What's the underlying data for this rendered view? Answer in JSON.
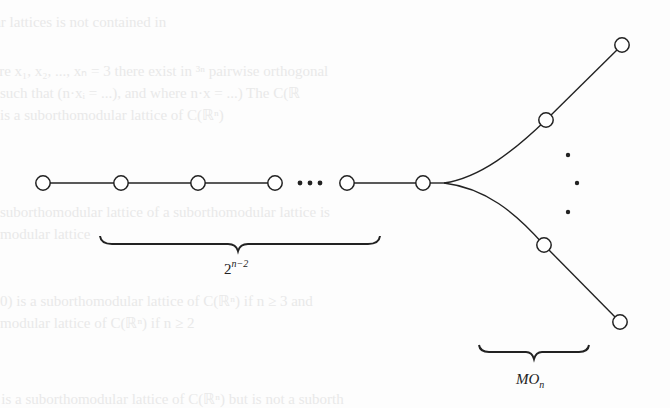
{
  "figure": {
    "type": "lattice-diagram",
    "colors": {
      "stroke": "#222222",
      "node_fill": "#ffffff",
      "background": "#fdfdfd",
      "bleed_text": "#e9e9e9"
    },
    "chain": {
      "nodes": [
        {
          "id": "c1",
          "x": 43,
          "y": 183
        },
        {
          "id": "c2",
          "x": 121,
          "y": 183
        },
        {
          "id": "c3",
          "x": 198,
          "y": 183
        },
        {
          "id": "c4",
          "x": 275,
          "y": 183
        },
        {
          "id": "c5",
          "x": 347,
          "y": 183
        },
        {
          "id": "c6",
          "x": 423,
          "y": 183
        }
      ],
      "ellipsis": "• • •",
      "brace_label_base": "2",
      "brace_label_exp": "n−2"
    },
    "fork": {
      "upper_nodes": [
        {
          "id": "u1",
          "x": 546,
          "y": 120
        },
        {
          "id": "u2",
          "x": 622,
          "y": 45
        }
      ],
      "lower_nodes": [
        {
          "id": "l1",
          "x": 544,
          "y": 245
        },
        {
          "id": "l2",
          "x": 620,
          "y": 322
        }
      ],
      "vertical_ellipsis": [
        {
          "x": 568,
          "y": 155
        },
        {
          "x": 577,
          "y": 183
        },
        {
          "x": 568,
          "y": 212
        }
      ],
      "brace_label_base": "MO",
      "brace_label_sub": "n"
    },
    "bleed_through_lines": [
      "nodular lattices is not contained in",
      "(here x₁, x₂, ..., xₙ = 3 there exist in ³ⁿ pairwise orthogonal",
      "such that (n·xᵢ = ...), and where n·x = ...) The C(ℝ",
      "is a suborthomodular lattice of C(ℝⁿ)",
      "suborthomodular lattice of a suborthomodular lattice is",
      "modular lattice",
      "0) is a suborthomodular lattice of C(ℝⁿ) if n ≥ 3 and",
      "modular lattice of C(ℝⁿ) if n ≥ 2",
      "n is a suborthomodular lattice of C(ℝⁿ) but is not a suborth"
    ]
  }
}
